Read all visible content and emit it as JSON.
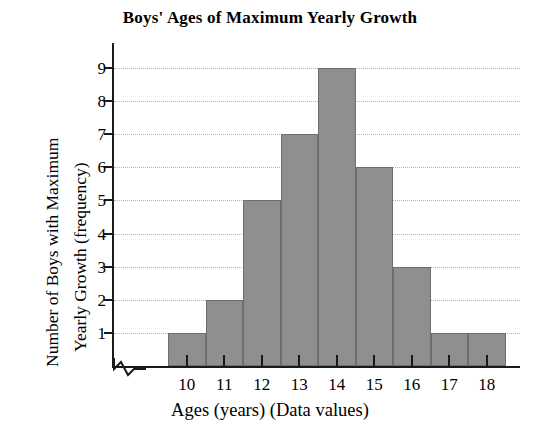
{
  "chart_data": {
    "type": "bar",
    "title": "Boys' Ages of Maximum Yearly Growth",
    "xlabel": "Ages (years) (Data values)",
    "ylabel_line1": "Number of Boys with Maximum",
    "ylabel_line2": "Yearly Growth (frequency)",
    "ylabel": "Number of Boys with Maximum Yearly Growth (frequency)",
    "categories": [
      "10",
      "11",
      "12",
      "13",
      "14",
      "15",
      "16",
      "17",
      "18"
    ],
    "values": [
      1,
      2,
      5,
      7,
      9,
      6,
      3,
      1,
      1
    ],
    "xtick_labels": [
      "10",
      "11",
      "12",
      "13",
      "14",
      "15",
      "16",
      "17",
      "18"
    ],
    "ytick_labels": [
      "1",
      "2",
      "3",
      "4",
      "5",
      "6",
      "7",
      "8",
      "9"
    ],
    "ytick_values": [
      1,
      2,
      3,
      4,
      5,
      6,
      7,
      8,
      9
    ],
    "ylim": [
      0,
      9.6
    ],
    "xlim": [
      9.5,
      18.5
    ],
    "grid": true,
    "grid_axis": "y",
    "grid_style": "dotted",
    "legend": false,
    "axis_break": true,
    "axis_break_note": "zigzag break on x-axis between origin and first bin",
    "bar_fill_color": "#8f8f8f",
    "bar_edge_color": "#6e6e6e",
    "grid_color": "#b4b4b4",
    "axis_color": "#1a1a1a",
    "background_color": "#ffffff"
  }
}
